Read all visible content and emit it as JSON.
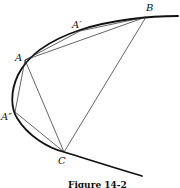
{
  "figure": {
    "caption": "Figure 14-2",
    "labels": {
      "A": "A",
      "A_prime": "A′",
      "A_double_prime": "A″",
      "B": "B",
      "C": "C"
    },
    "points": {
      "A": [
        25,
        60
      ],
      "A_prime": [
        80,
        31
      ],
      "A_double_prime": [
        15,
        112
      ],
      "B": [
        146,
        17
      ],
      "C": [
        64,
        152
      ]
    },
    "colors": {
      "ink": "#111111",
      "background": "#ffffff"
    }
  }
}
